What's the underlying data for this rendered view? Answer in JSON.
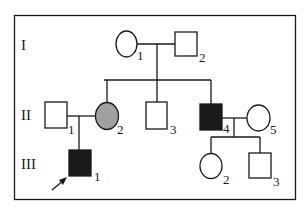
{
  "diagram": {
    "type": "pedigree",
    "colors": {
      "line": "#1a1a1a",
      "affected": "#1a1a1a",
      "carrier": "#a0a0a0",
      "unaffected": "#ffffff"
    },
    "generations": [
      {
        "label": "I"
      },
      {
        "label": "II"
      },
      {
        "label": "III"
      }
    ],
    "individuals": [
      {
        "id": "I-1",
        "label": "1",
        "sex": "female",
        "status": "unaffected"
      },
      {
        "id": "I-2",
        "label": "2",
        "sex": "male",
        "status": "unaffected"
      },
      {
        "id": "II-1",
        "label": "1",
        "sex": "male",
        "status": "unaffected"
      },
      {
        "id": "II-2",
        "label": "2",
        "sex": "female",
        "status": "shaded-gray"
      },
      {
        "id": "II-3",
        "label": "3",
        "sex": "male",
        "status": "unaffected"
      },
      {
        "id": "II-4",
        "label": "4",
        "sex": "male",
        "status": "affected"
      },
      {
        "id": "II-5",
        "label": "5",
        "sex": "female",
        "status": "unaffected"
      },
      {
        "id": "III-1",
        "label": "1",
        "sex": "male",
        "status": "affected",
        "proband": true
      },
      {
        "id": "III-2",
        "label": "2",
        "sex": "female",
        "status": "unaffected"
      },
      {
        "id": "III-3",
        "label": "3",
        "sex": "male",
        "status": "unaffected"
      }
    ]
  }
}
